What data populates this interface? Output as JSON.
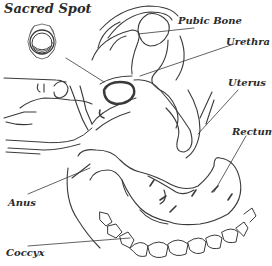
{
  "diagram": {
    "title": "Sacred Spot",
    "symbol": "chakra-lotus-symbol",
    "stroke_color": "#3a3a3a",
    "label_color": "#2a2a2a",
    "background": "#ffffff",
    "labels": [
      {
        "id": "pubic-bone",
        "text": "Pubic Bone"
      },
      {
        "id": "urethra",
        "text": "Urethra"
      },
      {
        "id": "uterus",
        "text": "Uterus"
      },
      {
        "id": "rectum",
        "text": "Rectum"
      },
      {
        "id": "anus",
        "text": "Anus"
      },
      {
        "id": "coccyx",
        "text": "Coccyx"
      }
    ]
  }
}
